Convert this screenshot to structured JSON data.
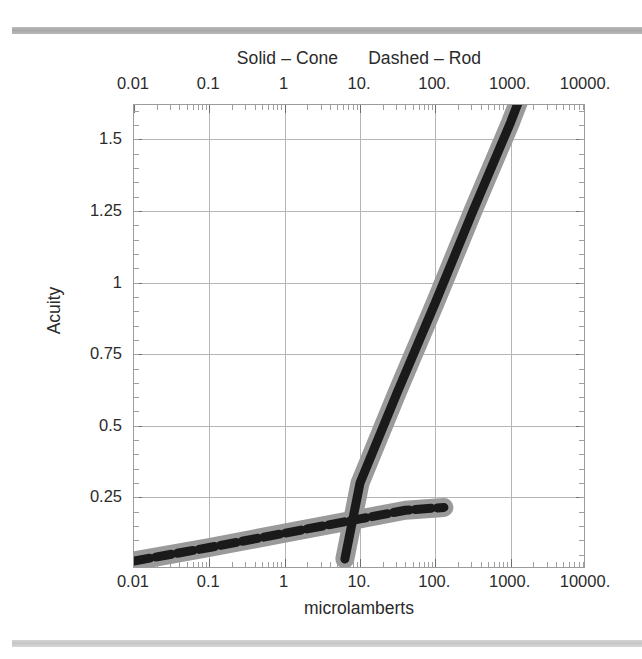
{
  "figure": {
    "legend_caption": "Solid – Cone    Dashed – Rod",
    "legend_solid": "Solid – Cone",
    "legend_dashed": "Dashed – Rod",
    "axis_title_x": "microlamberts",
    "axis_title_y": "Acuity",
    "frame_color": "#9b9b9b",
    "grid_color": "#b5b5b5",
    "curve_core_color": "#1a1a1a",
    "curve_halo_color": "#9a9a9a",
    "rule_top_color": "#a2a2a2",
    "rule_bottom_color": "#c2c2c2"
  },
  "chart_data": {
    "type": "line",
    "title": "Solid – Cone    Dashed – Rod",
    "xlabel": "microlamberts",
    "ylabel": "Acuity",
    "xscale": "log",
    "yscale": "linear",
    "xlim": [
      0.01,
      10000
    ],
    "ylim": [
      0,
      1.62
    ],
    "grid": true,
    "legend_position": "top-center-as-title",
    "xticks": [
      0.01,
      0.1,
      1,
      10,
      100,
      1000,
      10000
    ],
    "xticklabels": [
      "0.01",
      "0.1",
      "1",
      "10.",
      "100.",
      "1000.",
      "10000."
    ],
    "yticks": [
      0.25,
      0.5,
      0.75,
      1,
      1.25,
      1.5
    ],
    "yticklabels": [
      "0.25",
      "0.5",
      "0.75",
      "1",
      "1.25",
      "1.5"
    ],
    "xticklabels_top": [
      "0.01",
      "0.1",
      "1",
      "10.",
      "100.",
      "1000.",
      "10000."
    ],
    "series": [
      {
        "name": "Cone",
        "style": "solid",
        "linewidth_px": 9,
        "halo_px": 19,
        "points": [
          {
            "x": 6.3,
            "y": 0.035
          },
          {
            "x": 10,
            "y": 0.3
          },
          {
            "x": 31.6,
            "y": 0.62
          },
          {
            "x": 100,
            "y": 0.93
          },
          {
            "x": 316,
            "y": 1.25
          },
          {
            "x": 1000,
            "y": 1.56
          },
          {
            "x": 1600,
            "y": 1.7
          }
        ]
      },
      {
        "name": "Rod",
        "style": "dashed",
        "linewidth_px": 9,
        "halo_px": 19,
        "dash_px": [
          16,
          6
        ],
        "points": [
          {
            "x": 0.01,
            "y": 0.028
          },
          {
            "x": 0.1,
            "y": 0.075
          },
          {
            "x": 1,
            "y": 0.125
          },
          {
            "x": 10,
            "y": 0.175
          },
          {
            "x": 40,
            "y": 0.205
          },
          {
            "x": 130,
            "y": 0.215
          }
        ]
      }
    ]
  }
}
